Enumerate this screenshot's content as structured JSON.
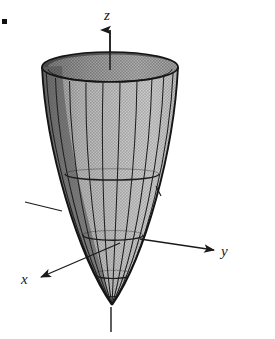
{
  "figure": {
    "kind": "3d-surface-plot",
    "background_color": "#ffffff",
    "ink_color": "#1a1a1a",
    "bullet_marker": "■"
  },
  "axes": {
    "z": {
      "label": "z",
      "direction": "up",
      "arrow": true,
      "origin_px": [
        110,
        255
      ],
      "tip_px": [
        110,
        27
      ],
      "tail_px": [
        110,
        332
      ]
    },
    "y": {
      "label": "y",
      "direction": "right-down",
      "arrow": true,
      "origin_px": [
        110,
        255
      ],
      "tip_px": [
        216,
        250
      ],
      "tail_px": [
        25,
        202
      ]
    },
    "x": {
      "label": "x",
      "direction": "lower-left",
      "arrow": true,
      "origin_px": [
        110,
        255
      ],
      "tip_px": [
        38,
        278
      ],
      "tail_px": [
        148,
        228
      ]
    }
  },
  "surface": {
    "type": "paraboloid",
    "equation": "z = x^2 + y^2",
    "apex_px": [
      112,
      305
    ],
    "rim_center_px": [
      110,
      67
    ],
    "rim_radius_x_px": 68,
    "rim_radius_y_px": 15,
    "mesh": {
      "meridian_count": 18,
      "parallel_count": 5,
      "parallel_levels_px": [
        67,
        175,
        236,
        275,
        295
      ]
    },
    "shading": {
      "outer_light": "#b4b4b4",
      "outer_mid": "#9a9a9a",
      "outer_dark": "#6e6e6e",
      "inner_dark": "#4a4a4a",
      "edge_stroke": "#1a1a1a"
    }
  },
  "labels": {
    "z": "z",
    "y": "y",
    "x": "x"
  }
}
